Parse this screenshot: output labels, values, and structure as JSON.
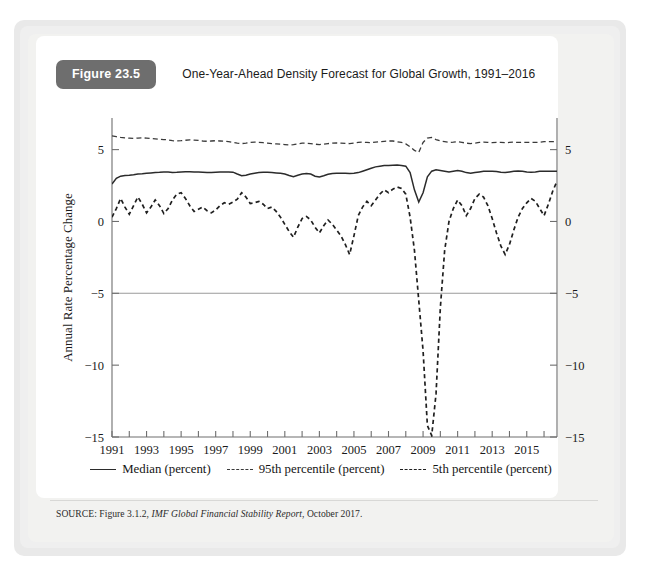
{
  "figure": {
    "badge": "Figure 23.5",
    "title": "One-Year-Ahead Density Forecast for Global Growth, 1991–2016",
    "source_prefix": "SOURCE: Figure 3.1.2, ",
    "source_italic": "IMF Global Financial Stability Report",
    "source_suffix": ", October 2017."
  },
  "legend": {
    "items": [
      {
        "label": "Median (percent)",
        "style": "solid",
        "color": "#2b2b2b"
      },
      {
        "label": "95th percentile (percent)",
        "style": "dashed",
        "color": "#3a3a3a"
      },
      {
        "label": "5th percentile (percent)",
        "style": "dashed",
        "color": "#1f1f1f"
      }
    ]
  },
  "chart_data": {
    "type": "line",
    "title": "One-Year-Ahead Density Forecast for Global Growth, 1991–2016",
    "xlabel": "",
    "ylabel": "Annual Rate Percentage Change",
    "xlim": [
      1991,
      2016.75
    ],
    "ylim": [
      -15,
      7.2
    ],
    "yticks": [
      5,
      0,
      -5,
      -10,
      -15
    ],
    "ytick_labels": [
      "5",
      "0",
      "−5",
      "−10",
      "−15"
    ],
    "right_axis": true,
    "right_ytick_labels": [
      "5",
      "0",
      "−5",
      "−10",
      "−15"
    ],
    "xticks": [
      1991,
      1993,
      1995,
      1997,
      1999,
      2001,
      2003,
      2005,
      2007,
      2009,
      2011,
      2013,
      2015
    ],
    "xtick_labels": [
      "1991",
      "1993",
      "1995",
      "1997",
      "1999",
      "2001",
      "2003",
      "2005",
      "2007",
      "2009",
      "2011",
      "2013",
      "2015"
    ],
    "minor_xticks": [
      1992,
      1994,
      1996,
      1998,
      2000,
      2002,
      2004,
      2006,
      2008,
      2010,
      2012,
      2014,
      2016
    ],
    "gridlines_y": [
      -5
    ],
    "grid": false,
    "legend_position": "below",
    "x_start": 1991.0,
    "x_step": 0.25,
    "series": [
      {
        "name": "Median (percent)",
        "style": "solid",
        "values": [
          2.6,
          3.0,
          3.15,
          3.2,
          3.22,
          3.25,
          3.3,
          3.32,
          3.35,
          3.38,
          3.4,
          3.42,
          3.45,
          3.45,
          3.4,
          3.42,
          3.45,
          3.46,
          3.46,
          3.45,
          3.44,
          3.42,
          3.4,
          3.4,
          3.42,
          3.44,
          3.45,
          3.45,
          3.43,
          3.3,
          3.18,
          3.22,
          3.3,
          3.36,
          3.4,
          3.42,
          3.42,
          3.4,
          3.38,
          3.36,
          3.3,
          3.2,
          3.12,
          3.22,
          3.3,
          3.34,
          3.3,
          3.15,
          3.1,
          3.18,
          3.28,
          3.34,
          3.36,
          3.36,
          3.35,
          3.34,
          3.35,
          3.4,
          3.5,
          3.6,
          3.7,
          3.8,
          3.85,
          3.9,
          3.9,
          3.92,
          3.93,
          3.9,
          3.85,
          3.4,
          2.2,
          1.35,
          2.0,
          3.1,
          3.5,
          3.6,
          3.55,
          3.5,
          3.45,
          3.5,
          3.55,
          3.5,
          3.4,
          3.35,
          3.4,
          3.45,
          3.5,
          3.5,
          3.5,
          3.48,
          3.42,
          3.4,
          3.45,
          3.5,
          3.52,
          3.5,
          3.45,
          3.42,
          3.45,
          3.5,
          3.5,
          3.5,
          3.5,
          3.5
        ]
      },
      {
        "name": "95th percentile (percent)",
        "style": "dashed",
        "values": [
          5.95,
          5.9,
          5.85,
          5.82,
          5.8,
          5.78,
          5.8,
          5.82,
          5.8,
          5.78,
          5.75,
          5.72,
          5.7,
          5.68,
          5.62,
          5.6,
          5.62,
          5.65,
          5.68,
          5.66,
          5.64,
          5.6,
          5.58,
          5.6,
          5.62,
          5.6,
          5.58,
          5.55,
          5.5,
          5.45,
          5.42,
          5.45,
          5.5,
          5.52,
          5.5,
          5.48,
          5.45,
          5.42,
          5.4,
          5.38,
          5.35,
          5.32,
          5.35,
          5.4,
          5.45,
          5.45,
          5.42,
          5.38,
          5.35,
          5.38,
          5.42,
          5.45,
          5.46,
          5.45,
          5.44,
          5.42,
          5.45,
          5.5,
          5.52,
          5.5,
          5.48,
          5.52,
          5.55,
          5.58,
          5.6,
          5.6,
          5.55,
          5.5,
          5.4,
          5.2,
          4.95,
          4.8,
          5.5,
          5.8,
          5.85,
          5.7,
          5.6,
          5.55,
          5.5,
          5.52,
          5.55,
          5.5,
          5.45,
          5.42,
          5.45,
          5.5,
          5.52,
          5.5,
          5.48,
          5.5,
          5.5,
          5.48,
          5.5,
          5.52,
          5.5,
          5.5,
          5.5,
          5.5,
          5.5,
          5.52,
          5.55,
          5.55,
          5.55,
          5.55
        ]
      },
      {
        "name": "5th percentile (percent)",
        "style": "dashed",
        "values": [
          0.3,
          0.9,
          1.6,
          1.0,
          0.5,
          1.1,
          1.7,
          1.2,
          0.6,
          1.0,
          1.5,
          1.1,
          0.55,
          0.9,
          1.5,
          1.9,
          2.0,
          1.6,
          1.1,
          0.7,
          0.85,
          1.0,
          0.75,
          0.6,
          0.8,
          1.1,
          1.3,
          1.2,
          1.35,
          1.55,
          2.0,
          1.7,
          1.25,
          1.3,
          1.4,
          1.2,
          0.9,
          1.0,
          0.7,
          0.3,
          -0.2,
          -0.7,
          -1.1,
          -0.4,
          0.2,
          0.35,
          0.1,
          -0.4,
          -0.8,
          -0.3,
          0.1,
          -0.2,
          -0.6,
          -1.0,
          -1.6,
          -2.3,
          -1.0,
          0.4,
          1.0,
          1.4,
          1.1,
          1.5,
          1.9,
          2.2,
          2.0,
          2.25,
          2.4,
          2.3,
          1.9,
          0.3,
          -2.0,
          -5.5,
          -9.0,
          -14.2,
          -14.9,
          -12.0,
          -6.0,
          -2.0,
          0.0,
          0.9,
          1.5,
          1.1,
          0.4,
          0.9,
          1.6,
          1.9,
          1.7,
          1.1,
          0.2,
          -0.8,
          -1.7,
          -2.3,
          -1.6,
          -0.6,
          0.3,
          0.9,
          1.3,
          1.6,
          1.4,
          0.9,
          0.4,
          1.2,
          2.1,
          2.8
        ]
      }
    ]
  }
}
